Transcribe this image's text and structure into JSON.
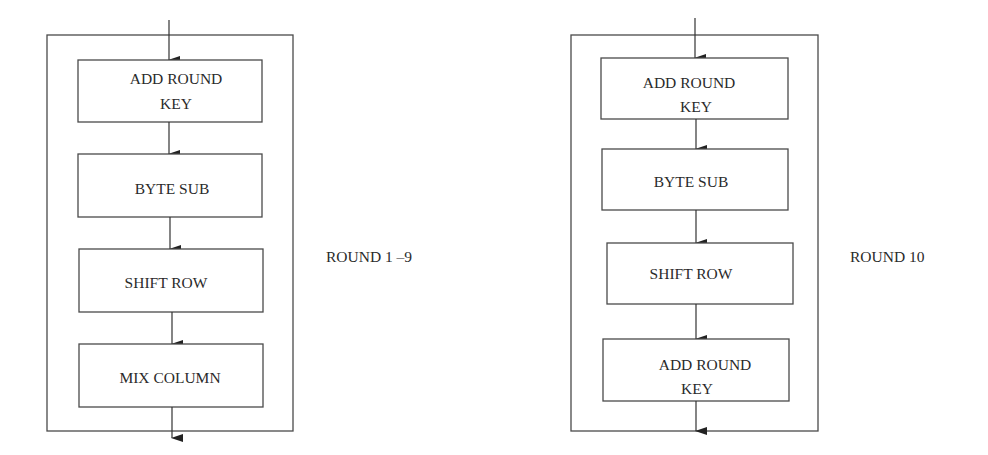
{
  "diagrams": [
    {
      "round_label": "ROUND 1 –9",
      "steps": [
        {
          "lines": [
            "ADD ROUND",
            "KEY"
          ]
        },
        {
          "lines": [
            "BYTE SUB"
          ]
        },
        {
          "lines": [
            "SHIFT ROW"
          ]
        },
        {
          "lines": [
            "MIX COLUMN"
          ]
        }
      ]
    },
    {
      "round_label": "ROUND 10",
      "steps": [
        {
          "lines": [
            "ADD ROUND",
            "KEY"
          ]
        },
        {
          "lines": [
            "BYTE SUB"
          ]
        },
        {
          "lines": [
            "SHIFT ROW"
          ]
        },
        {
          "lines": [
            "ADD ROUND",
            "KEY"
          ]
        }
      ]
    }
  ]
}
